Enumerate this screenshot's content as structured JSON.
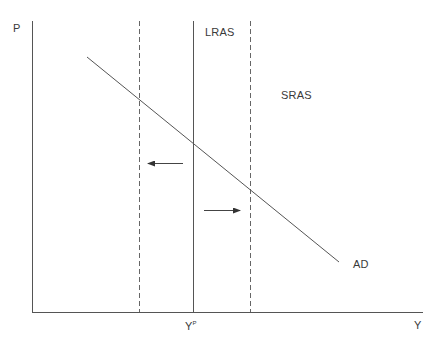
{
  "diagram": {
    "axes": {
      "y_label": "P",
      "x_label": "Y",
      "potential_output_label": "Y",
      "potential_output_superscript": "P"
    },
    "curves": {
      "lras": {
        "label": "LRAS",
        "style": "solid"
      },
      "sras": {
        "label": "SRAS",
        "style": "dashed",
        "count": 2
      },
      "ad": {
        "label": "AD",
        "style": "solid"
      }
    },
    "arrows": [
      {
        "direction": "left",
        "meaning": "shift of SRAS to the left"
      },
      {
        "direction": "right",
        "meaning": "shift of SRAS to the right"
      }
    ],
    "colors": {
      "line": "#555555",
      "text": "#3a3a3a",
      "background": "#ffffff"
    }
  }
}
